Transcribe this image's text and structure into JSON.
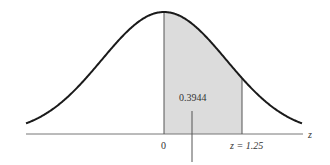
{
  "figure": {
    "type": "normal-distribution-shaded-area",
    "area_label": "0.3944",
    "mean_label": "0",
    "z_label": "z = 1.25",
    "z_value": 1.25,
    "axis_label": "z",
    "colors": {
      "curve": "#1a1a1a",
      "axis": "#555555",
      "shade": "#dcdcdc",
      "boundary": "#555555",
      "text": "#333333"
    }
  }
}
